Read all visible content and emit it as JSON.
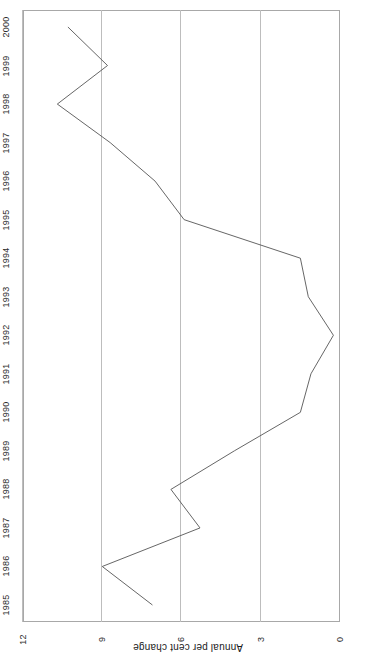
{
  "chart_data": {
    "type": "line",
    "title": "",
    "subtitle": "",
    "xlabel": "",
    "ylabel": "Annual per cent change",
    "categories": [
      1985,
      1986,
      1987,
      1988,
      1989,
      1990,
      1991,
      1992,
      1993,
      1994,
      1995,
      1996,
      1997,
      1998,
      1999,
      2000
    ],
    "category_tick_labels": [
      "1985",
      "1986",
      "1987",
      "1988",
      "1989",
      "1990",
      "1991",
      "1992",
      "1993",
      "1994",
      "1995",
      "1996",
      "1997",
      "1998",
      "1999",
      "2000"
    ],
    "values": [
      7.1,
      9.0,
      5.3,
      6.4,
      4.0,
      1.5,
      1.1,
      0.25,
      1.2,
      1.5,
      5.9,
      7.0,
      8.7,
      10.7,
      8.8,
      10.3
    ],
    "series": [
      {
        "name": "Annual per cent change",
        "values": [
          7.1,
          9.0,
          5.3,
          6.4,
          4.0,
          1.5,
          1.1,
          0.25,
          1.2,
          1.5,
          5.9,
          7.0,
          8.7,
          10.7,
          8.8,
          10.3
        ]
      }
    ],
    "value_axis_ticks": [
      0,
      3,
      6,
      9,
      12
    ],
    "value_axis_tick_labels": [
      "0",
      "3",
      "6",
      "9",
      "12"
    ],
    "ylim": [
      0,
      12
    ],
    "grid": "value-axis-only",
    "legend": "none",
    "orientation": "rotated-180",
    "line_color": "#555555",
    "grid_color": "#bdbdbd",
    "frame_color": "#a8a8a8",
    "background_color": "#ffffff",
    "annotations": []
  }
}
